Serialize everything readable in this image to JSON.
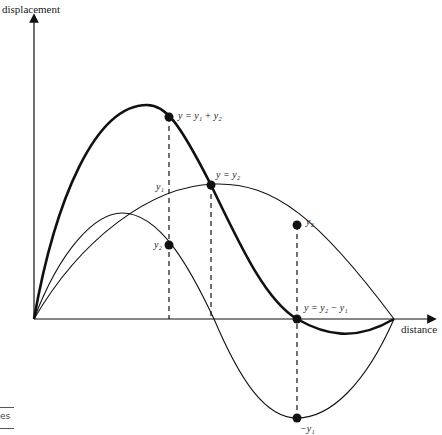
{
  "diagram": {
    "type": "wave-superposition",
    "axes": {
      "y_label": "displacement",
      "x_label": "distance"
    },
    "curves": [
      {
        "name": "long-wave",
        "style": "thin"
      },
      {
        "name": "short-wave",
        "style": "thin"
      },
      {
        "name": "resultant",
        "style": "thick"
      }
    ],
    "labels": {
      "sum": "y = y₁ + y₂",
      "equal": "y = y₂",
      "y1_left": "y₁",
      "y2_left": "y₂",
      "y2_right": "y₂",
      "diff": "y = y₂ − y₁",
      "neg_y1": "−y₁"
    },
    "colors": {
      "stroke": "#111111",
      "background": "#ffffff"
    }
  },
  "edge_fragment": {
    "text": "es"
  }
}
